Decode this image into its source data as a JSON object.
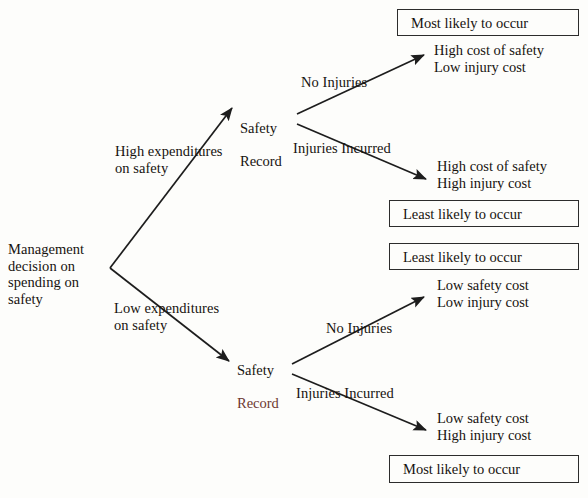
{
  "diagram": {
    "root": {
      "label": "Management\ndecision on\nspending on\nsafety"
    },
    "branches": [
      {
        "label": "High expenditures\non safety"
      },
      {
        "label": "Low expenditures\non safety"
      }
    ],
    "nodes": [
      {
        "line1": "Safety",
        "line2": "Record",
        "line2_colored": false
      },
      {
        "line1": "Safety",
        "line2": "Record",
        "line2_colored": true
      }
    ],
    "sub_branches": [
      {
        "label": "No Injuries"
      },
      {
        "label": "Injuries Incurred"
      },
      {
        "label": "No Injuries"
      },
      {
        "label": "Injuries Incurred"
      }
    ],
    "outcomes": [
      {
        "text": "High cost of safety\nLow injury cost"
      },
      {
        "text": "High cost of safety\nHigh injury cost"
      },
      {
        "text": "Low safety cost\nLow injury cost"
      },
      {
        "text": "Low safety cost\nHigh injury cost"
      }
    ],
    "callouts": [
      {
        "text": "Most likely to occur"
      },
      {
        "text": "Least likely to occur"
      },
      {
        "text": "Least likely to occur"
      },
      {
        "text": "Most likely to occur"
      }
    ]
  },
  "colors": {
    "line": "#1d1d1d",
    "text": "#17130f",
    "accent_red": "#6d3830",
    "box_border": "#2c2c2c",
    "background": "#fdfdfb"
  }
}
